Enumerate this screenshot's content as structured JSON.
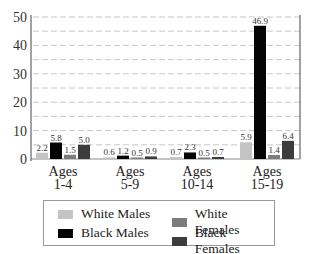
{
  "chart_data": {
    "type": "bar",
    "title": "",
    "xlabel": "",
    "ylabel": "",
    "ylim": [
      0,
      50
    ],
    "yticks": [
      0,
      10,
      20,
      30,
      40,
      50
    ],
    "grid": "dashed horizontal every 5",
    "categories": [
      [
        "Ages",
        "1-4"
      ],
      [
        "Ages",
        "5-9"
      ],
      [
        "Ages",
        "10-14"
      ],
      [
        "Ages",
        "15-19"
      ]
    ],
    "series": [
      {
        "name": "White Males",
        "color": "#c4c4c4",
        "values": [
          2.2,
          0.6,
          0.7,
          5.9
        ]
      },
      {
        "name": "Black Males",
        "color": "#050505",
        "values": [
          5.8,
          1.2,
          2.3,
          46.9
        ]
      },
      {
        "name": "White Females",
        "color": "#7c7c7c",
        "values": [
          1.5,
          0.5,
          0.5,
          1.4
        ]
      },
      {
        "name": "Black Females",
        "color": "#3c3c3c",
        "values": [
          5.0,
          0.9,
          0.7,
          6.4
        ]
      }
    ],
    "legend_position": "bottom",
    "legend_layout": [
      [
        "White Males",
        "White Females"
      ],
      [
        "Black Males",
        "Black Females"
      ]
    ]
  }
}
